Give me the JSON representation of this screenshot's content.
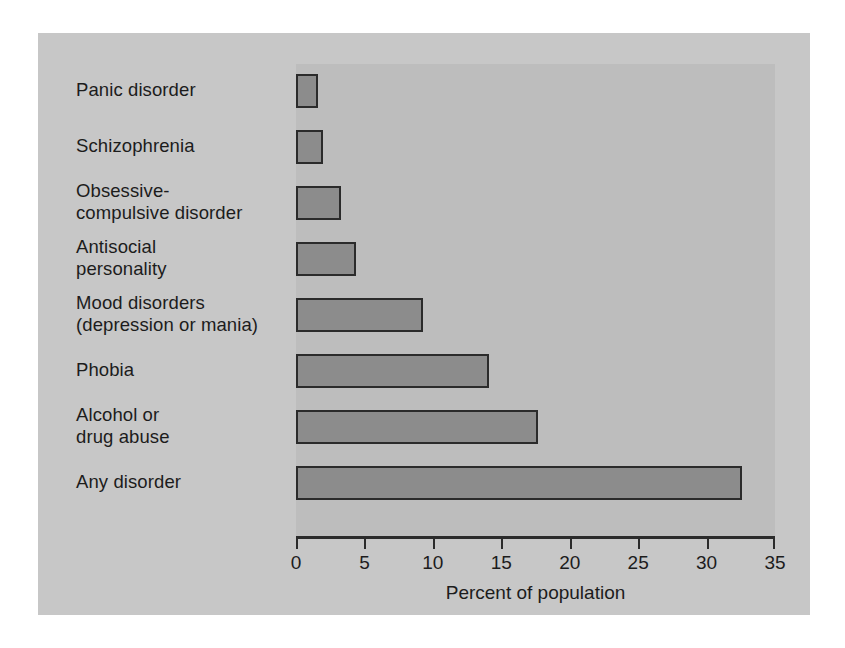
{
  "chart_data": {
    "type": "bar",
    "orientation": "horizontal",
    "title": "",
    "xlabel": "Percent of population",
    "ylabel": "",
    "xlim": [
      0,
      35
    ],
    "xticks": [
      0,
      5,
      10,
      15,
      20,
      25,
      30,
      35
    ],
    "xtick_labels": [
      "0",
      "5",
      "10",
      "15",
      "20",
      "25",
      "30",
      "35"
    ],
    "grid": false,
    "legend": null,
    "categories": [
      "Panic disorder",
      "Schizophrenia",
      "Obsessive-\ncompulsive disorder",
      "Antisocial\npersonality",
      "Mood disorders\n(depression or mania)",
      "Phobia",
      "Alcohol or\ndrug abuse",
      "Any disorder"
    ],
    "values": [
      1.6,
      2.0,
      3.3,
      4.4,
      9.3,
      14.1,
      17.7,
      32.6
    ],
    "colors": {
      "bar_fill": "#8c8c8c",
      "bar_border": "#2b2b2b",
      "panel_background": "#c7c7c7",
      "plot_background": "#bdbdbd",
      "text": "#1c1c1c",
      "axis": "#2b2b2b"
    }
  }
}
